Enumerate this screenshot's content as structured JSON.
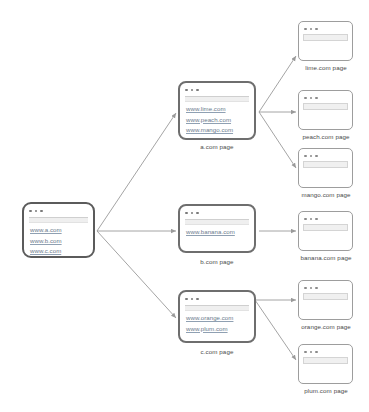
{
  "diagram": {
    "type": "site-crawl-tree",
    "stroke_color": "#9a9a9a",
    "link_color": "#6a7a8c",
    "root_border_color": "#5b5b5b"
  },
  "root": {
    "name": "root-page",
    "links": [
      "www.a.com",
      "www.b.com",
      "www.c.com"
    ]
  },
  "mid": [
    {
      "id": "a",
      "caption": "a.com page",
      "links": [
        "www.lime.com",
        "www.peach.com",
        "www.mango.com"
      ]
    },
    {
      "id": "b",
      "caption": "b.com page",
      "links": [
        "www.banana.com"
      ]
    },
    {
      "id": "c",
      "caption": "c.com page",
      "links": [
        "www.orange.com",
        "www.plum.com"
      ]
    }
  ],
  "leaves": [
    {
      "id": "lime",
      "caption": "lime.com page"
    },
    {
      "id": "peach",
      "caption": "peach.com page"
    },
    {
      "id": "mango",
      "caption": "mango.com page"
    },
    {
      "id": "banana",
      "caption": "banana.com page"
    },
    {
      "id": "orange",
      "caption": "orange.com page"
    },
    {
      "id": "plum",
      "caption": "plum.com page"
    }
  ]
}
